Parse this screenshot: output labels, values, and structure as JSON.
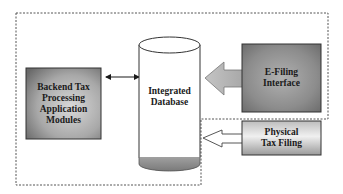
{
  "diagram": {
    "type": "system-architecture",
    "nodes": {
      "backend": {
        "lines": [
          "Backend Tax",
          "Processing",
          "Application",
          "Modules"
        ],
        "shape": "gradient-rectangle"
      },
      "database": {
        "lines": [
          "Integrated",
          "Database"
        ],
        "shape": "cylinder"
      },
      "efiling": {
        "lines": [
          "E-Filing",
          "Interface"
        ],
        "shape": "gradient-rectangle"
      },
      "physical": {
        "lines": [
          "Physical",
          "Tax Filing"
        ],
        "shape": "gradient-rectangle"
      }
    },
    "edges": [
      {
        "from": "backend",
        "to": "database",
        "style": "double-headed-arrow"
      },
      {
        "from": "efiling",
        "to": "database",
        "style": "block-arrow"
      },
      {
        "from": "physical",
        "to": "database",
        "style": "outline-block-arrow"
      }
    ],
    "colors": {
      "box_dark": "#6e6e6e",
      "box_light": "#d6d6d6",
      "arrow_fill": "#b8b8b8",
      "dashed_border": "#555555",
      "cylinder_base": "#8a8a8a"
    }
  }
}
